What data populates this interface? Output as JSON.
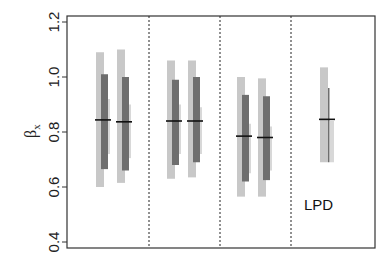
{
  "chart_data": {
    "type": "interval",
    "title": "",
    "xlabel": "",
    "ylabel": "βx",
    "ylim": [
      0.4,
      1.2
    ],
    "yticks": [
      0.4,
      0.6,
      0.8,
      1.0,
      1.2
    ],
    "ytick_labels": [
      "0.4",
      "0.6",
      "0.8",
      "1.0",
      "1.2"
    ],
    "grid": false,
    "panels": [
      {
        "label": "",
        "groups": [
          {
            "outer": [
              0.6,
              1.09
            ],
            "inner": [
              0.665,
              1.01
            ],
            "narrow": [
              0.72,
              0.92
            ],
            "median": 0.844
          },
          {
            "outer": [
              0.615,
              1.1
            ],
            "inner": [
              0.66,
              1.0
            ],
            "narrow": [
              0.705,
              0.9
            ],
            "median": 0.837
          }
        ]
      },
      {
        "label": "",
        "groups": [
          {
            "outer": [
              0.63,
              1.06
            ],
            "inner": [
              0.68,
              0.99
            ],
            "narrow": [
              0.72,
              0.9
            ],
            "median": 0.84
          },
          {
            "outer": [
              0.635,
              1.06
            ],
            "inner": [
              0.69,
              1.0
            ],
            "narrow": [
              0.72,
              0.89
            ],
            "median": 0.84
          }
        ]
      },
      {
        "label": "",
        "groups": [
          {
            "outer": [
              0.565,
              1.0
            ],
            "inner": [
              0.62,
              0.935
            ],
            "narrow": [
              0.65,
              0.83
            ],
            "median": 0.785
          },
          {
            "outer": [
              0.565,
              0.995
            ],
            "inner": [
              0.625,
              0.93
            ],
            "narrow": [
              0.66,
              0.82
            ],
            "median": 0.78
          }
        ]
      },
      {
        "label": "LPD",
        "groups": [
          {
            "outer": [
              0.69,
              1.035
            ],
            "inner": [
              0.69,
              0.96
            ],
            "narrow": [
              0.69,
              0.84
            ],
            "median": 0.846,
            "inner_style": "thin-line"
          }
        ]
      }
    ],
    "separators": "dotted vertical lines between panels",
    "colors": {
      "outer": "#c8c8c8",
      "inner": "#6e6e6e",
      "narrow": "#d8d8d8",
      "median": "#111111"
    }
  },
  "labels": {
    "ylabel_main": "β",
    "ylabel_sub": "x",
    "panel4": "LPD"
  }
}
